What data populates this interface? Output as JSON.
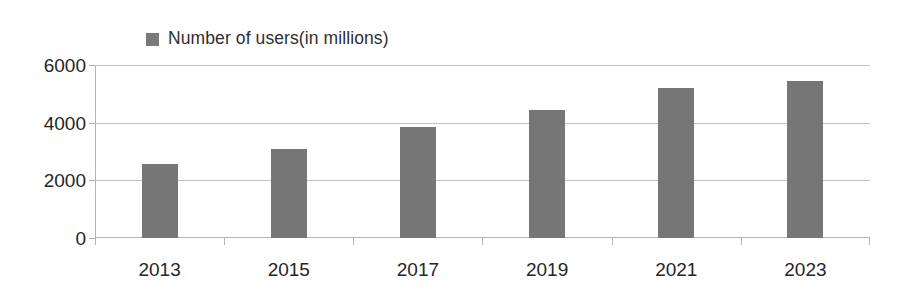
{
  "legend": {
    "entries": [
      {
        "label": "Number of users(in millions)",
        "color": "#7a7a7a"
      }
    ]
  },
  "axes": {
    "y_ticks": [
      "0",
      "2000",
      "4000",
      "6000"
    ],
    "x_ticks": [
      "2013",
      "2015",
      "2017",
      "2019",
      "2021",
      "2023"
    ]
  },
  "chart_data": {
    "type": "bar",
    "title": "",
    "subtitle": "",
    "xlabel": "",
    "ylabel": "",
    "categories": [
      "2013",
      "2015",
      "2017",
      "2019",
      "2021",
      "2023"
    ],
    "series": [
      {
        "name": "Number of users(in millions)",
        "color": "#767676",
        "values": [
          2550,
          3100,
          3850,
          4450,
          5200,
          5450
        ]
      }
    ],
    "values": [
      2550,
      3100,
      3850,
      4450,
      5200,
      5450
    ],
    "ylim": [
      0,
      6000
    ],
    "y_tick_values": [
      0,
      2000,
      4000,
      6000
    ],
    "grid": true,
    "grid_axis": "y",
    "legend_position": "top-center",
    "bar_color": "#767676",
    "background_color": "#ffffff"
  }
}
